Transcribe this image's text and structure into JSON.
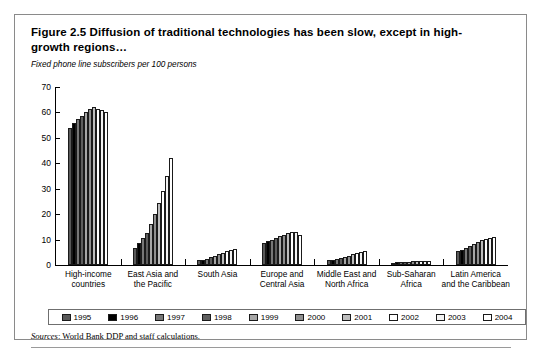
{
  "figure": {
    "title": "Figure 2.5  Diffusion of traditional technologies has been slow, except in high-growth regions…",
    "unit_label": "Fixed phone line subscribers per 100 persons",
    "source_prefix": "Sources",
    "source_text": ": World Bank DDP and staff calculations."
  },
  "chart_data": {
    "type": "bar",
    "title": "Figure 2.5  Diffusion of traditional technologies has been slow, except in high-growth regions…",
    "subtitle": "",
    "xlabel": "",
    "ylabel": "Fixed phone line subscribers per 100 persons",
    "ylim": [
      0,
      70
    ],
    "yticks": [
      0,
      10,
      20,
      30,
      40,
      50,
      60,
      70
    ],
    "grid": false,
    "legend_position": "bottom",
    "categories": [
      "High-income\ncountries",
      "East Asia and\nthe Pacific",
      "South Asia",
      "Europe and\nCentral Asia",
      "Middle East and\nNorth Africa",
      "Sub-Saharan\nAfrica",
      "Latin America\nand the Caribbean"
    ],
    "series": [
      {
        "name": "1995",
        "color": "#595959",
        "values": [
          54.0,
          6.5,
          1.8,
          8.8,
          1.8,
          0.9,
          5.5
        ]
      },
      {
        "name": "1996",
        "color": "#000000",
        "values": [
          56.0,
          8.5,
          2.1,
          9.3,
          2.0,
          1.0,
          6.0
        ]
      },
      {
        "name": "1997",
        "color": "#777777",
        "values": [
          57.5,
          10.5,
          2.5,
          10.0,
          2.3,
          1.1,
          6.6
        ]
      },
      {
        "name": "1998",
        "color": "#5e5e5e",
        "values": [
          58.5,
          12.5,
          3.0,
          10.8,
          2.6,
          1.2,
          7.3
        ]
      },
      {
        "name": "1999",
        "color": "#a6a6a6",
        "values": [
          60.0,
          16.0,
          3.6,
          11.4,
          3.2,
          1.3,
          8.1
        ]
      },
      {
        "name": "2000",
        "color": "#8f8f8f",
        "values": [
          61.5,
          20.0,
          4.2,
          11.9,
          3.7,
          1.4,
          9.0
        ]
      },
      {
        "name": "2001",
        "color": "#bdbdbd",
        "values": [
          62.0,
          24.5,
          4.8,
          12.4,
          4.2,
          1.4,
          9.8
        ]
      },
      {
        "name": "2002",
        "color": "#ffffff",
        "values": [
          61.5,
          29.0,
          5.4,
          12.8,
          4.7,
          1.5,
          10.3
        ]
      },
      {
        "name": "2003",
        "color": "#f2f2f2",
        "values": [
          61.0,
          35.0,
          5.8,
          13.0,
          5.1,
          1.5,
          10.8
        ]
      },
      {
        "name": "2004",
        "color": "#ffffff",
        "values": [
          60.0,
          42.0,
          6.3,
          11.8,
          5.5,
          1.5,
          11.2
        ]
      }
    ]
  }
}
